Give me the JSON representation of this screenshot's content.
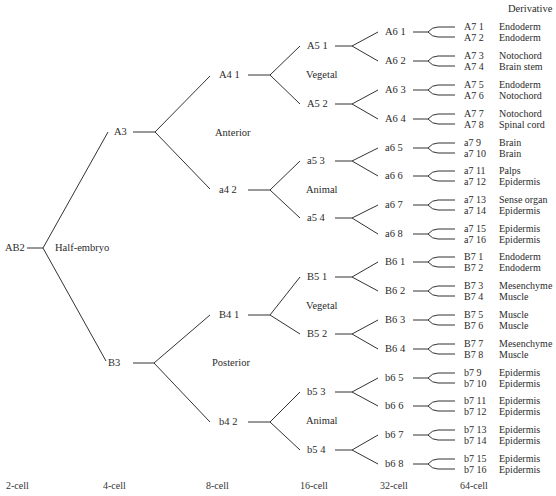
{
  "header": {
    "derivative_label": "Derivative"
  },
  "root": {
    "label": "AB2",
    "region": "Half-embryo"
  },
  "level2": [
    {
      "label": "A3",
      "region": "Anterior"
    },
    {
      "label": "B3",
      "region": "Posterior"
    }
  ],
  "level3": [
    {
      "label": "A4 1",
      "region": "Vegetal"
    },
    {
      "label": "a4 2",
      "region": "Animal"
    },
    {
      "label": "B4 1",
      "region": "Vegetal"
    },
    {
      "label": "b4 2",
      "region": "Animal"
    }
  ],
  "level4": [
    "A5 1",
    "A5 2",
    "a5 3",
    "a5 4",
    "B5 1",
    "B5 2",
    "b5 3",
    "b5 4"
  ],
  "level5": [
    "A6 1",
    "A6 2",
    "A6 3",
    "A6 4",
    "a6 5",
    "a6 6",
    "a6 7",
    "a6 8",
    "B6 1",
    "B6 2",
    "B6 3",
    "B6 4",
    "b6 5",
    "b6 6",
    "b6 7",
    "b6 8"
  ],
  "level6": [
    {
      "cell": "A7 1",
      "derivative": "Endoderm"
    },
    {
      "cell": "A7 2",
      "derivative": "Endoderm"
    },
    {
      "cell": "A7 3",
      "derivative": "Notochord"
    },
    {
      "cell": "A7 4",
      "derivative": "Brain stem"
    },
    {
      "cell": "A7 5",
      "derivative": "Endoderm"
    },
    {
      "cell": "A7 6",
      "derivative": "Notochord"
    },
    {
      "cell": "A7 7",
      "derivative": "Notochord"
    },
    {
      "cell": "A7 8",
      "derivative": "Spinal cord"
    },
    {
      "cell": "a7 9",
      "derivative": "Brain"
    },
    {
      "cell": "a7 10",
      "derivative": "Brain"
    },
    {
      "cell": "a7 11",
      "derivative": "Palps"
    },
    {
      "cell": "a7 12",
      "derivative": "Epidermis"
    },
    {
      "cell": "a7 13",
      "derivative": "Sense organ"
    },
    {
      "cell": "a7 14",
      "derivative": "Epidermis"
    },
    {
      "cell": "a7 15",
      "derivative": "Epidermis"
    },
    {
      "cell": "a7 16",
      "derivative": "Epidermis"
    },
    {
      "cell": "B7 1",
      "derivative": "Endoderm"
    },
    {
      "cell": "B7 2",
      "derivative": "Endoderm"
    },
    {
      "cell": "B7 3",
      "derivative": "Mesenchyme"
    },
    {
      "cell": "B7 4",
      "derivative": "Muscle"
    },
    {
      "cell": "B7 5",
      "derivative": "Muscle"
    },
    {
      "cell": "B7 6",
      "derivative": "Muscle"
    },
    {
      "cell": "B7 7",
      "derivative": "Mesenchyme"
    },
    {
      "cell": "B7 8",
      "derivative": "Muscle"
    },
    {
      "cell": "b7 9",
      "derivative": "Epidermis"
    },
    {
      "cell": "b7 10",
      "derivative": "Epidermis"
    },
    {
      "cell": "b7 11",
      "derivative": "Epidermis"
    },
    {
      "cell": "b7 12",
      "derivative": "Epidermis"
    },
    {
      "cell": "b7 13",
      "derivative": "Epidermis"
    },
    {
      "cell": "b7 14",
      "derivative": "Epidermis"
    },
    {
      "cell": "b7 15",
      "derivative": "Epidermis"
    },
    {
      "cell": "b7 16",
      "derivative": "Epidermis"
    }
  ],
  "stages": [
    "2-cell",
    "4-cell",
    "8-cell",
    "16-cell",
    "32-cell",
    "64-cell"
  ],
  "colors": {
    "line": "#333333",
    "text": "#2b2b2b",
    "background": "#ffffff"
  }
}
